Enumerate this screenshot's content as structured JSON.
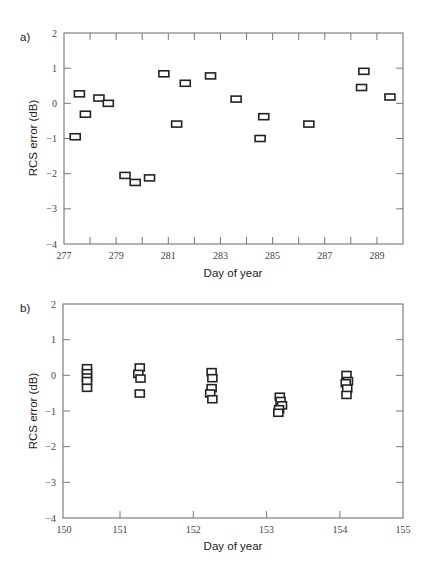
{
  "chart_data": [
    {
      "type": "scatter",
      "panel_label": "a)",
      "title": "",
      "xlabel": "Day of year",
      "ylabel": "RCS error (dB)",
      "xlim": [
        277,
        290
      ],
      "ylim": [
        -4,
        2
      ],
      "grid": false,
      "legend": null,
      "xticks": [
        277,
        278,
        279,
        280,
        281,
        282,
        283,
        284,
        285,
        286,
        287,
        288,
        289,
        290
      ],
      "xtick_labels": [
        "277",
        "279",
        "281",
        "283",
        "285",
        "287",
        "289"
      ],
      "xtick_label_values": [
        277,
        279,
        281,
        283,
        285,
        287,
        289
      ],
      "yticks": [
        2,
        1,
        0,
        -1,
        -2,
        -3,
        -4
      ],
      "ytick_labels": [
        "2",
        "1",
        "0",
        "−1",
        "−2",
        "−3",
        "−4"
      ],
      "marker": "open-rectangle",
      "x": [
        277.43,
        277.59,
        277.82,
        278.34,
        278.7,
        279.34,
        279.73,
        280.28,
        280.83,
        281.32,
        281.65,
        282.62,
        283.6,
        284.52,
        284.66,
        286.39,
        288.41,
        288.5,
        289.5
      ],
      "y": [
        -0.95,
        0.27,
        -0.31,
        0.15,
        0.0,
        -2.05,
        -2.25,
        -2.12,
        0.84,
        -0.59,
        0.57,
        0.78,
        0.12,
        -1.0,
        -0.38,
        -0.59,
        0.45,
        0.91,
        0.18
      ]
    },
    {
      "type": "scatter",
      "panel_label": "b)",
      "title": "",
      "xlabel": "Day of year",
      "ylabel": "RCS error (dB)",
      "xlim": [
        150.2,
        155
      ],
      "ylim": [
        -4,
        2
      ],
      "grid": false,
      "legend": null,
      "xticks": [
        151,
        152,
        153,
        154
      ],
      "xtick_labels": [
        "150",
        "151",
        "152",
        "153",
        "154",
        "155"
      ],
      "xtick_label_values": [
        150.2,
        151,
        152,
        153,
        154,
        154.86
      ],
      "yticks": [
        2,
        1,
        0,
        -1,
        -2,
        -3,
        -4
      ],
      "ytick_labels": [
        "2",
        "1",
        "0",
        "−1",
        "−2",
        "−3",
        "−4"
      ],
      "marker": "open-square",
      "x": [
        150.55,
        150.55,
        150.55,
        150.55,
        150.55,
        151.27,
        151.25,
        151.28,
        151.27,
        152.25,
        152.26,
        152.25,
        152.23,
        152.26,
        153.18,
        153.19,
        153.21,
        153.17,
        153.16,
        154.09,
        154.11,
        154.08,
        154.1,
        154.09
      ],
      "y": [
        0.2,
        0.06,
        -0.06,
        -0.16,
        -0.35,
        0.22,
        0.04,
        -0.09,
        -0.51,
        0.09,
        -0.08,
        -0.36,
        -0.51,
        -0.67,
        -0.6,
        -0.72,
        -0.84,
        -0.95,
        -1.05,
        0.01,
        -0.16,
        -0.22,
        -0.37,
        -0.55
      ]
    }
  ],
  "panels": {
    "a": {
      "label": "a)",
      "xlabel": "Day of year",
      "ylabel": "RCS error (dB)"
    },
    "b": {
      "label": "b)",
      "xlabel": "Day of year",
      "ylabel": "RCS error (dB)"
    }
  }
}
